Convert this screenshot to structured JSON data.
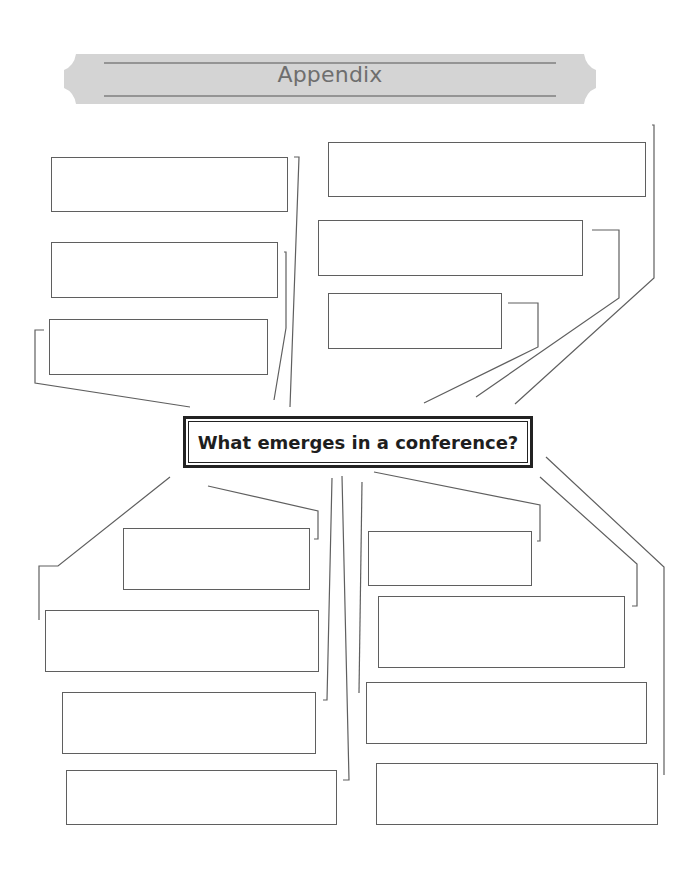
{
  "header": {
    "title": "Appendix"
  },
  "central": {
    "question": "What emerges in a conference?"
  },
  "colors": {
    "banner_fill": "#d4d4d4",
    "banner_text": "#6e6e6e",
    "line": "#5f5f5f",
    "central_border": "#222222"
  },
  "answer_boxes": [
    {
      "id": "tl1",
      "value": ""
    },
    {
      "id": "tl2",
      "value": ""
    },
    {
      "id": "tl3",
      "value": ""
    },
    {
      "id": "tr1",
      "value": ""
    },
    {
      "id": "tr2",
      "value": ""
    },
    {
      "id": "tr3",
      "value": ""
    },
    {
      "id": "bl1",
      "value": ""
    },
    {
      "id": "bl2",
      "value": ""
    },
    {
      "id": "bl3",
      "value": ""
    },
    {
      "id": "bl4",
      "value": ""
    },
    {
      "id": "br1",
      "value": ""
    },
    {
      "id": "br2",
      "value": ""
    },
    {
      "id": "br3",
      "value": ""
    },
    {
      "id": "br4",
      "value": ""
    }
  ]
}
